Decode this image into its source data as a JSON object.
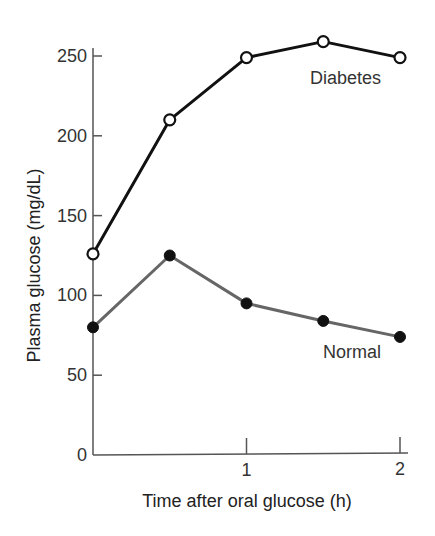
{
  "chart_data": {
    "type": "line",
    "title": "",
    "xlabel": "Time after oral glucose (h)",
    "ylabel": "Plasma glucose (mg/dL)",
    "xlim": [
      0,
      2
    ],
    "ylim": [
      0,
      250
    ],
    "x_ticks": [
      1,
      2
    ],
    "x_tick_labels": [
      "1",
      "2"
    ],
    "y_ticks": [
      0,
      50,
      100,
      150,
      200,
      250
    ],
    "y_tick_labels": [
      "0",
      "50",
      "100",
      "150",
      "200",
      "250"
    ],
    "grid": false,
    "legend": "inline labels",
    "x": [
      0,
      0.5,
      1,
      1.5,
      2
    ],
    "series": [
      {
        "name": "Diabetes",
        "label": "Diabetes",
        "values": [
          126,
          210,
          249,
          259,
          249
        ],
        "color": "#111111",
        "marker": "open-circle"
      },
      {
        "name": "Normal",
        "label": "Normal",
        "values": [
          80,
          125,
          95,
          84,
          74
        ],
        "color": "#666666",
        "marker": "filled-circle"
      }
    ]
  }
}
